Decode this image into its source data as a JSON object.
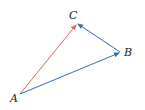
{
  "diagram": {
    "type": "vector-triangle",
    "points": {
      "A": {
        "label": "A",
        "x": 20,
        "y": 94
      },
      "B": {
        "label": "B",
        "x": 120,
        "y": 52
      },
      "C": {
        "label": "C",
        "x": 77,
        "y": 23
      }
    },
    "vectors": [
      {
        "name": "AC",
        "from": "A",
        "to": "C",
        "color": "#e06666"
      },
      {
        "name": "AB",
        "from": "A",
        "to": "B",
        "color": "#2e6db4"
      },
      {
        "name": "BC",
        "from": "B",
        "to": "C",
        "color": "#2e6db4"
      }
    ],
    "colors": {
      "resultant": "#e06666",
      "component": "#2e6db4",
      "label": "#222222",
      "background": "#ffffff"
    }
  }
}
